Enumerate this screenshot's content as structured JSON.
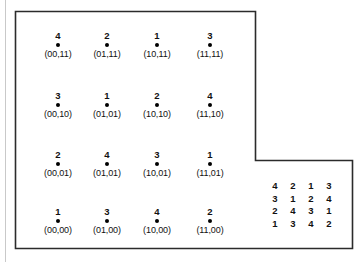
{
  "figure": {
    "grid": {
      "rows": [
        {
          "cells": [
            {
              "rank": "4",
              "label": "(00,11)"
            },
            {
              "rank": "2",
              "label": "(01,11)"
            },
            {
              "rank": "1",
              "label": "(10,11)"
            },
            {
              "rank": "3",
              "label": "(11,11)"
            }
          ]
        },
        {
          "cells": [
            {
              "rank": "3",
              "label": "(00,10)"
            },
            {
              "rank": "1",
              "label": "(01,01)"
            },
            {
              "rank": "2",
              "label": "(10,10)"
            },
            {
              "rank": "4",
              "label": "(11,10)"
            }
          ]
        },
        {
          "cells": [
            {
              "rank": "2",
              "label": "(00,01)"
            },
            {
              "rank": "4",
              "label": "(01,01)"
            },
            {
              "rank": "3",
              "label": "(10,01)"
            },
            {
              "rank": "1",
              "label": "(11,01)"
            }
          ]
        },
        {
          "cells": [
            {
              "rank": "1",
              "label": "(00,00)"
            },
            {
              "rank": "3",
              "label": "(01,00)"
            },
            {
              "rank": "4",
              "label": "(10,00)"
            },
            {
              "rank": "2",
              "label": "(11,00)"
            }
          ]
        }
      ]
    },
    "matrix": {
      "rows": [
        [
          "4",
          "2",
          "1",
          "3"
        ],
        [
          "3",
          "1",
          "2",
          "4"
        ],
        [
          "2",
          "4",
          "3",
          "1"
        ],
        [
          "1",
          "3",
          "4",
          "2"
        ]
      ]
    },
    "colors": {
      "ink": "#111111",
      "border": "#2b2b2b",
      "dot": "#000000",
      "scan_edge": "#c9c9c9"
    }
  }
}
